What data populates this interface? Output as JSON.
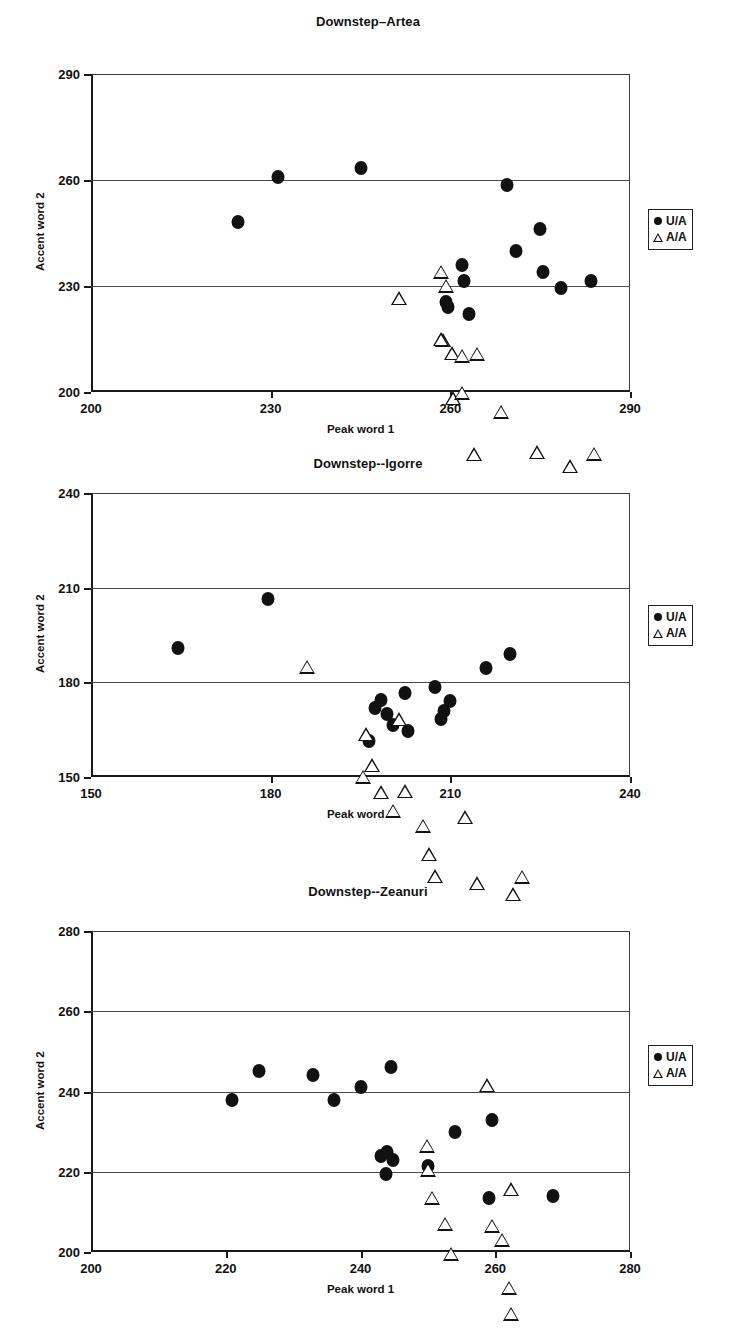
{
  "document": {
    "kind": "figure-page",
    "panel_count": 3
  },
  "legend": {
    "entries": [
      {
        "label": "U/A",
        "marker": "filled-circle"
      },
      {
        "label": "A/A",
        "marker": "open-triangle"
      }
    ]
  },
  "chart_data": [
    {
      "id": "artea",
      "type": "scatter",
      "title": "Downstep–Artea",
      "xlabel": "Peak word 1",
      "ylabel": "Accent word 2",
      "xlim": [
        200,
        290
      ],
      "ylim": [
        200,
        290
      ],
      "xticks": [
        200,
        230,
        260,
        290
      ],
      "yticks": [
        200,
        230,
        260,
        290
      ],
      "grid": true,
      "legend_position": "right",
      "series": [
        {
          "name": "U/A",
          "marker": "filled-circle",
          "points": [
            [
              224.5,
              248.0
            ],
            [
              231.3,
              260.8
            ],
            [
              245.0,
              263.5
            ],
            [
              259.3,
              225.5
            ],
            [
              259.6,
              224.0
            ],
            [
              262.0,
              236.0
            ],
            [
              262.3,
              231.5
            ],
            [
              263.2,
              222.0
            ],
            [
              269.5,
              258.5
            ],
            [
              271.0,
              240.0
            ],
            [
              275.0,
              246.0
            ],
            [
              275.5,
              234.0
            ],
            [
              278.5,
              229.5
            ],
            [
              283.5,
              231.5
            ]
          ]
        },
        {
          "name": "A/A",
          "marker": "open-triangle",
          "points": [
            [
              251.5,
              226.5
            ],
            [
              258.5,
              238.0
            ],
            [
              259.3,
              238.0
            ],
            [
              258.7,
              226.5
            ],
            [
              258.5,
              230.8
            ],
            [
              260.3,
              230.8
            ],
            [
              260.5,
              222.0
            ],
            [
              262.0,
              238.0
            ],
            [
              262.0,
              231.5
            ],
            [
              264.5,
              246.5
            ],
            [
              264.0,
              222.0
            ],
            [
              268.5,
              238.0
            ],
            [
              274.5,
              230.5
            ],
            [
              280.0,
              230.5
            ],
            [
              284.0,
              238.0
            ]
          ]
        }
      ]
    },
    {
      "id": "igorre",
      "type": "scatter",
      "title": "Downstep--Igorre",
      "xlabel": "Peak word 1",
      "ylabel": "Accent word 2",
      "xlim": [
        150,
        240
      ],
      "ylim": [
        150,
        240
      ],
      "xticks": [
        150,
        180,
        210,
        240
      ],
      "yticks": [
        150,
        180,
        210,
        240
      ],
      "grid": true,
      "legend_position": "right",
      "points_note": "scatter of peak-word-1 vs accent-word-2",
      "series": [
        {
          "name": "U/A",
          "marker": "filled-circle",
          "points": [
            [
              164.5,
              191.0
            ],
            [
              179.5,
              206.5
            ],
            [
              196.5,
              161.5
            ],
            [
              197.5,
              172.0
            ],
            [
              198.5,
              174.5
            ],
            [
              199.5,
              170.0
            ],
            [
              200.5,
              166.5
            ],
            [
              202.5,
              176.5
            ],
            [
              203.0,
              164.5
            ],
            [
              207.5,
              178.5
            ],
            [
              208.5,
              168.5
            ],
            [
              209.0,
              171.0
            ],
            [
              210.0,
              174.0
            ],
            [
              216.0,
              184.5
            ],
            [
              220.0,
              189.0
            ]
          ]
        },
        {
          "name": "A/A",
          "marker": "open-triangle",
          "points": [
            [
              186.0,
              185.0
            ],
            [
              195.5,
              154.5
            ],
            [
              196.0,
              172.5
            ],
            [
              197.0,
              167.0
            ],
            [
              198.5,
              163.0
            ],
            [
              200.5,
              161.5
            ],
            [
              201.5,
              195.0
            ],
            [
              202.5,
              176.5
            ],
            [
              205.5,
              170.0
            ],
            [
              206.5,
              165.5
            ],
            [
              207.5,
              163.0
            ],
            [
              212.5,
              186.0
            ],
            [
              214.5,
              169.5
            ],
            [
              220.5,
              170.5
            ],
            [
              222.0,
              180.5
            ]
          ]
        }
      ]
    },
    {
      "id": "zeanuri",
      "type": "scatter",
      "title": "Downstep--Zeanuri",
      "xlabel": "Peak word 1",
      "ylabel": "Accent word 2",
      "xlim": [
        200,
        280
      ],
      "ylim": [
        200,
        280
      ],
      "xticks": [
        200,
        220,
        240,
        260,
        280
      ],
      "yticks": [
        200,
        220,
        240,
        260,
        280
      ],
      "grid": true,
      "legend_position": "right",
      "series": [
        {
          "name": "U/A",
          "marker": "filled-circle",
          "points": [
            [
              221.0,
              238.0
            ],
            [
              225.0,
              245.0
            ],
            [
              233.0,
              244.0
            ],
            [
              236.0,
              238.0
            ],
            [
              240.0,
              241.0
            ],
            [
              243.0,
              224.0
            ],
            [
              244.0,
              225.0
            ],
            [
              244.5,
              246.0
            ],
            [
              243.8,
              219.5
            ],
            [
              244.8,
              223.0
            ],
            [
              250.0,
              221.5
            ],
            [
              254.0,
              230.0
            ],
            [
              259.5,
              233.0
            ],
            [
              259.0,
              213.5
            ],
            [
              268.5,
              214.0
            ]
          ]
        },
        {
          "name": "A/A",
          "marker": "open-triangle",
          "points": [
            [
              249.8,
              226.5
            ],
            [
              250.0,
              224.0
            ],
            [
              250.6,
              220.5
            ],
            [
              252.5,
              217.5
            ],
            [
              253.5,
              213.5
            ],
            [
              258.8,
              259.0
            ],
            [
              259.5,
              227.5
            ],
            [
              261.0,
              227.5
            ],
            [
              262.3,
              243.5
            ],
            [
              262.0,
              222.5
            ],
            [
              262.3,
              219.5
            ],
            [
              262.0,
              215.0
            ],
            [
              263.2,
              217.0
            ],
            [
              263.2,
              214.0
            ],
            [
              274.0,
              222.5
            ]
          ]
        }
      ]
    }
  ]
}
